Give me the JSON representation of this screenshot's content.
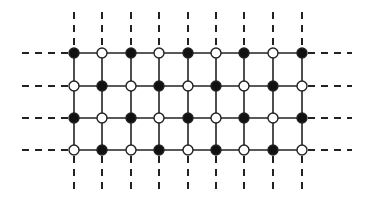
{
  "diagram": {
    "type": "lattice",
    "columns": [
      74,
      102,
      131,
      159,
      188,
      216,
      244,
      273,
      302
    ],
    "rows": [
      53,
      86,
      118,
      150
    ],
    "first_node_filled": true,
    "node_radius": 5,
    "edge_color": "#222222",
    "filled_node_color": "#111111",
    "open_node_fill": "#ffffff",
    "dash_extent": {
      "left_x": 22,
      "right_x": 352,
      "top_y": 12,
      "bottom_y": 192
    },
    "legend": {
      "filled": "filled-node",
      "open": "open-node"
    }
  }
}
